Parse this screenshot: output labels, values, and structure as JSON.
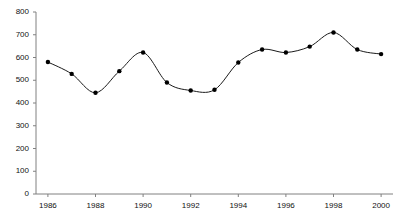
{
  "chart_data": {
    "type": "line",
    "title": "",
    "subtitle": "",
    "xlabel": "",
    "ylabel": "",
    "xlim": [
      1985.5,
      2000.5
    ],
    "ylim": [
      0,
      800
    ],
    "grid": false,
    "legend": null,
    "markers": "filled-circle",
    "line_color": "#1a1a1a",
    "marker_color": "#000000",
    "axis_color": "#808080",
    "x": [
      1986,
      1987,
      1988,
      1989,
      1990,
      1991,
      1992,
      1993,
      1994,
      1995,
      1996,
      1997,
      1998,
      1999,
      2000
    ],
    "values": [
      580,
      528,
      445,
      540,
      622,
      490,
      455,
      458,
      578,
      635,
      622,
      648,
      710,
      635,
      615
    ],
    "ytick_values": [
      0,
      100,
      200,
      300,
      400,
      500,
      600,
      700,
      800
    ],
    "ytick_labels": [
      "0",
      "100",
      "200",
      "300",
      "400",
      "500",
      "600",
      "700",
      "800"
    ],
    "xtick_values": [
      1986,
      1988,
      1990,
      1992,
      1994,
      1996,
      1998,
      2000
    ],
    "xtick_labels": [
      "1986",
      "1988",
      "1990",
      "1992",
      "1994",
      "1996",
      "1998",
      "2000"
    ]
  }
}
